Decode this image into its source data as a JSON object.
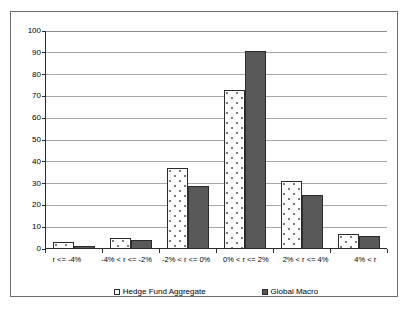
{
  "chart_data": {
    "type": "bar",
    "title": "",
    "xlabel": "",
    "ylabel": "",
    "ylim": [
      0,
      100
    ],
    "yticks": [
      0,
      10,
      20,
      30,
      40,
      50,
      60,
      70,
      80,
      90,
      100
    ],
    "grid": true,
    "legend_position": "bottom",
    "categories": [
      "r <= -4%",
      "-4% < r <= -2%",
      "-2% < r <= 0%",
      "0% < r <= 2%",
      "2% < r <= 4%",
      "4% < r"
    ],
    "series": [
      {
        "name": "Hedge Fund Aggregate",
        "color": "#ffffff",
        "pattern": "dotted",
        "values": [
          3,
          5,
          37,
          73,
          31,
          7
        ]
      },
      {
        "name": "Global Macro",
        "color": "#595959",
        "pattern": "solid",
        "values": [
          1.5,
          4,
          29,
          91,
          25,
          6
        ]
      }
    ]
  },
  "axis": {
    "tick_labels": [
      "0",
      "10",
      "20",
      "30",
      "40",
      "50",
      "60",
      "70",
      "80",
      "90",
      "100"
    ]
  },
  "legend": {
    "entries": [
      {
        "label": "Hedge Fund Aggregate"
      },
      {
        "label": "Global Macro"
      }
    ]
  },
  "colors": {
    "series_a_fill": "#ffffff",
    "series_a_dots": "#7a7a7a",
    "series_b_fill": "#595959",
    "axis_line": "#2b2b2b",
    "gridline": "#a8a8a8",
    "frame_border": "#6b6b6b",
    "background": "#ffffff"
  }
}
